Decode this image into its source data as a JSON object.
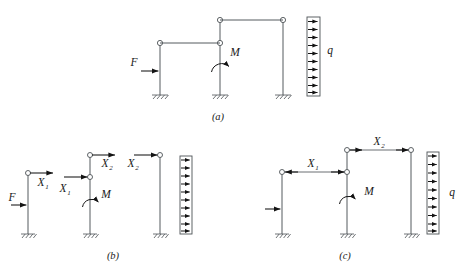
{
  "figure": {
    "background_color": "#ffffff",
    "line_color": "#555a5e",
    "arrow_color": "#141414",
    "text_color": "#1a1a1a",
    "panels": [
      {
        "id": "a",
        "caption": "(a)",
        "caption_x": 218,
        "caption_y": 120,
        "description": "Original frame: three fixed-base columns, two horizontal beams, point load F, moment M, distributed load q",
        "loads": [
          {
            "name": "force-F",
            "label": "F",
            "sub": "",
            "x": 140,
            "y": 66,
            "type": "point-force",
            "direction": "right"
          },
          {
            "name": "moment-M",
            "label": "M",
            "sub": "",
            "x": 235,
            "y": 56,
            "type": "moment",
            "direction": "ccw"
          },
          {
            "name": "load-q",
            "label": "q",
            "sub": "",
            "x": 330,
            "y": 54,
            "type": "distributed",
            "direction": "right"
          }
        ]
      },
      {
        "id": "b",
        "caption": "(b)",
        "caption_x": 113,
        "caption_y": 259,
        "description": "Released primary system split into separate columns with redundant forces X1 and X2",
        "loads": [
          {
            "name": "force-F",
            "label": "F",
            "sub": "",
            "x": 12,
            "y": 200,
            "type": "point-force",
            "direction": "right"
          },
          {
            "name": "redundant-X1-left",
            "label": "X",
            "sub": "1",
            "x": 41,
            "y": 178,
            "type": "redundant",
            "direction": "right"
          },
          {
            "name": "redundant-X1-middle",
            "label": "X",
            "sub": "1",
            "x": 63,
            "y": 189,
            "type": "redundant",
            "direction": "right"
          },
          {
            "name": "redundant-X2-middle",
            "label": "X",
            "sub": "2",
            "x": 104,
            "y": 160,
            "type": "redundant",
            "direction": "right"
          },
          {
            "name": "redundant-X2-right",
            "label": "X",
            "sub": "2",
            "x": 131,
            "y": 160,
            "type": "redundant",
            "direction": "right"
          },
          {
            "name": "moment-M",
            "label": "M",
            "sub": "",
            "x": 104,
            "y": 196,
            "type": "moment",
            "direction": "ccw"
          }
        ]
      },
      {
        "id": "c",
        "caption": "(c)",
        "caption_x": 345,
        "caption_y": 259,
        "description": "Equivalent frame with internal redundants X1 and X2 shown as paired arrows, distributed load q",
        "loads": [
          {
            "name": "force-unlabeled",
            "label": "",
            "sub": "",
            "x": 255,
            "y": 209,
            "type": "point-force",
            "direction": "right"
          },
          {
            "name": "redundant-X1",
            "label": "X",
            "sub": "1",
            "x": 313,
            "y": 172,
            "type": "redundant-pair",
            "direction": "both-in"
          },
          {
            "name": "redundant-X2",
            "label": "X",
            "sub": "2",
            "x": 392,
            "y": 144,
            "type": "redundant-pair",
            "direction": "both-out"
          },
          {
            "name": "moment-M",
            "label": "M",
            "sub": "",
            "x": 368,
            "y": 193,
            "type": "moment",
            "direction": "ccw"
          },
          {
            "name": "load-q",
            "label": "q",
            "sub": "",
            "x": 453,
            "y": 196,
            "type": "distributed",
            "direction": "right"
          }
        ]
      }
    ]
  }
}
